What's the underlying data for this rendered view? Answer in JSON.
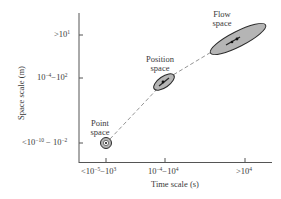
{
  "axes": {
    "x_label": "Time scale (s)",
    "y_label": "Space scale (m)",
    "x_ticks": [
      {
        "base": "<10",
        "exp1": "−5",
        "mid": "−10",
        "exp2": "3"
      },
      {
        "base": "10",
        "exp1": "−4",
        "mid": "−10",
        "exp2": "4"
      },
      {
        "base": ">10",
        "exp1": "4"
      }
    ],
    "y_ticks": [
      {
        "base": ">10",
        "exp1": "1"
      },
      {
        "base": "10",
        "exp1": "−4",
        "mid": "−10",
        "exp2": "2"
      },
      {
        "base": "<10",
        "exp1": "−10",
        "mid": " − 10",
        "exp2": "−2"
      }
    ]
  },
  "regions": [
    {
      "name": "Point",
      "line2": "space"
    },
    {
      "name": "Position",
      "line2": "space"
    },
    {
      "name": "Flow",
      "line2": "space"
    }
  ],
  "colors": {
    "axis": "#555555",
    "fill": "#b5b5b5",
    "stroke": "#2a2a2a",
    "dash": "#888888"
  }
}
